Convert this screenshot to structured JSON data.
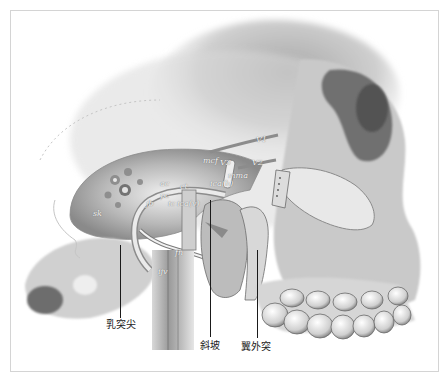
{
  "figure": {
    "colors": {
      "background": "#ffffff",
      "frame": "#d4d4d4",
      "bone_light": "#ececec",
      "bone_mid": "#bdbdbd",
      "bone_dark": "#6e6e6e",
      "leader": "#1a1a1a"
    }
  },
  "labels": {
    "v1": "V1",
    "v2": "V2",
    "v3": "V3",
    "mcf": "mcf",
    "mma": "mma",
    "ica_h": "ica(h)",
    "ct": "ct",
    "ica_v": "ica(v)",
    "pc": "pc",
    "ac": "ac",
    "jb": "jb",
    "ic": "ic",
    "sk": "sk",
    "fn": "fn",
    "ijv": "ijv"
  },
  "callouts": {
    "mastoid_tip": "乳突尖",
    "clivus": "斜坡",
    "lateral_pterygoid_plate": "翼外突"
  }
}
